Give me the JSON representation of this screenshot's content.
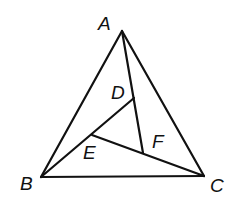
{
  "figure": {
    "stroke_color": "#111111",
    "background": "#ffffff"
  },
  "points": {
    "A": {
      "label": "A"
    },
    "B": {
      "label": "B"
    },
    "C": {
      "label": "C"
    },
    "D": {
      "label": "D"
    },
    "E": {
      "label": "E"
    },
    "F": {
      "label": "F"
    }
  },
  "segments": [
    {
      "from": "A",
      "to": "B"
    },
    {
      "from": "B",
      "to": "C"
    },
    {
      "from": "C",
      "to": "A"
    },
    {
      "from": "A",
      "to": "F"
    },
    {
      "from": "B",
      "to": "D"
    },
    {
      "from": "E",
      "to": "C"
    }
  ]
}
